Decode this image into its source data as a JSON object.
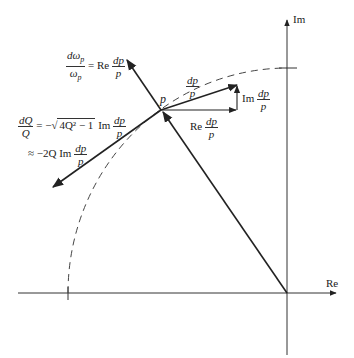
{
  "diagram": {
    "type": "complex-plane pole sensitivity",
    "axes": {
      "real_label": "Re",
      "imag_label": "Im"
    },
    "point_label": "p",
    "labels": {
      "dp_over_p": {
        "num": "dp",
        "den": "p"
      },
      "re_dp_p": {
        "prefix": "Re",
        "num": "dp",
        "den": "p"
      },
      "im_dp_p": {
        "prefix": "Im",
        "num": "dp",
        "den": "p"
      },
      "domega": {
        "lhs_num": "dω",
        "lhs_num_sub": "p",
        "lhs_den": "ω",
        "lhs_den_sub": "p",
        "eq": "= Re",
        "rhs_num": "dp",
        "rhs_den": "p"
      },
      "dQ": {
        "lhs_num": "dQ",
        "lhs_den": "Q",
        "eq": "= −",
        "sqrt_body": "4Q² − 1",
        "im": "Im",
        "rhs_num": "dp",
        "rhs_den": "p"
      },
      "dQ_approx": {
        "prefix": "≈ −2Q Im",
        "rhs_num": "dp",
        "rhs_den": "p"
      }
    },
    "colors": {
      "line": "#222222",
      "axis": "#333333",
      "dashed_arc": "#444444"
    }
  }
}
